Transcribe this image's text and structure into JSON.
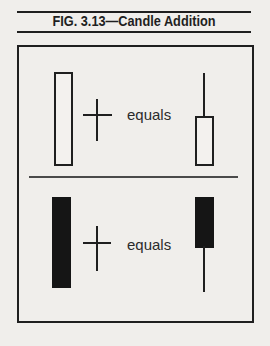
{
  "figure": {
    "title": "FIG. 3.13—Candle Addition",
    "rows": [
      {
        "id": "white-candle-addition",
        "left_candle": "tall white hollow body",
        "operator": "plus sign (doji cross)",
        "equals_label": "equals",
        "result_candle": "white body with long upper shadow"
      },
      {
        "id": "black-candle-addition",
        "left_candle": "tall black filled body",
        "operator": "plus sign (doji cross)",
        "equals_label": "equals",
        "result_candle": "black body with long lower shadow"
      }
    ]
  },
  "colors": {
    "paper": "#f0eeeb",
    "ink": "#1f1f1f",
    "candle_fill_black": "#151515",
    "candle_fill_white": "#f3f1ee"
  }
}
